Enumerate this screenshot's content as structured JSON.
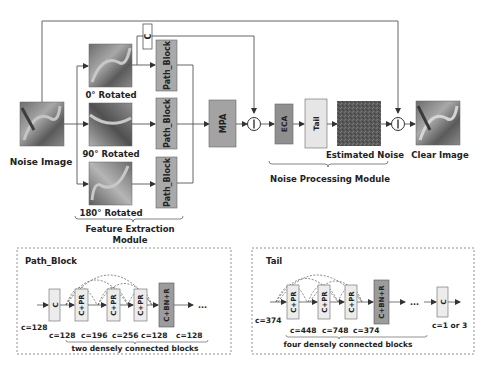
{
  "top": {
    "input_label": "Noise Image",
    "rotations": [
      {
        "label": "0° Rotated"
      },
      {
        "label": "90° Rotated"
      },
      {
        "label": "180° Rotated"
      }
    ],
    "concat_label": "C",
    "path_block_label": "Path_Block",
    "mpa_label": "MPA",
    "eca_label": "ECA",
    "tail_label": "Tail",
    "estimated_noise_label": "Estimated Noise",
    "output_label": "Clear Image",
    "feature_module_line1": "Feature Extraction",
    "feature_module_line2": "Module",
    "noise_module_label": "Noise Processing Module",
    "subtract_symbol": "−"
  },
  "path_block_detail": {
    "title": "Path_Block",
    "blocks": [
      "C",
      "C+PR",
      "C+PR",
      "C+PR",
      "C+BN+R"
    ],
    "channels": [
      "c=128",
      "c=128",
      "c=196",
      "c=256",
      "c=128",
      "c=128"
    ],
    "ellipsis": "...",
    "caption": "two densely connected blocks"
  },
  "tail_detail": {
    "title": "Tail",
    "blocks": [
      "C+PR",
      "C+PR",
      "C+PR",
      "C+BN+R",
      "C"
    ],
    "channels": [
      "c=374",
      "c=448",
      "c=748",
      "c=374",
      "c=1 or 3"
    ],
    "ellipsis": "...",
    "caption": "four densely connected blocks"
  },
  "colors": {
    "path_block_fill": "#a9a9a9",
    "mpa_fill": "#a3a3a3",
    "eca_fill": "#8f8f8f",
    "tail_fill": "#e6e6e6",
    "light_block_fill": "#ececec",
    "bnr_fill": "#9c9c9c",
    "line": "#555555"
  }
}
